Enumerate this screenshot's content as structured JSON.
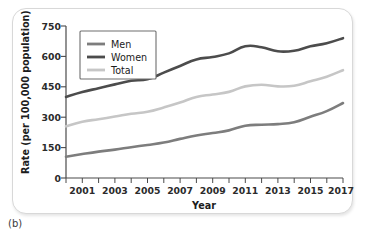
{
  "caption": "(b)",
  "chart_data": {
    "type": "line",
    "title": "",
    "xlabel": "Year",
    "ylabel": "Rate (per 100,000 population)",
    "xlim": [
      2000,
      2017
    ],
    "ylim": [
      0,
      750
    ],
    "yticks": [
      0,
      150,
      300,
      450,
      600,
      750
    ],
    "ytick_labels": [
      "0",
      "150",
      "300",
      "450",
      "600",
      "750"
    ],
    "x": [
      2000,
      2001,
      2002,
      2003,
      2004,
      2005,
      2006,
      2007,
      2008,
      2009,
      2010,
      2011,
      2012,
      2013,
      2014,
      2015,
      2016,
      2017
    ],
    "xtick_labels": [
      "",
      "2001",
      "",
      "2003",
      "",
      "2005",
      "",
      "2007",
      "",
      "2009",
      "",
      "2011",
      "",
      "2013",
      "",
      "2015",
      "",
      "2017"
    ],
    "grid": false,
    "legend_position": "top-left",
    "series": [
      {
        "name": "Men",
        "color": "#7d7d7d",
        "values": [
          105,
          118,
          130,
          140,
          152,
          163,
          175,
          193,
          210,
          222,
          235,
          258,
          263,
          266,
          275,
          302,
          330,
          370
        ]
      },
      {
        "name": "Women",
        "color": "#4c4c4c",
        "values": [
          400,
          424,
          443,
          462,
          480,
          487,
          520,
          553,
          585,
          597,
          615,
          650,
          645,
          625,
          628,
          650,
          665,
          690
        ]
      },
      {
        "name": "Total",
        "color": "#c6c6c6",
        "values": [
          255,
          278,
          290,
          303,
          317,
          327,
          348,
          372,
          400,
          412,
          425,
          452,
          460,
          452,
          455,
          477,
          500,
          532
        ]
      }
    ]
  }
}
